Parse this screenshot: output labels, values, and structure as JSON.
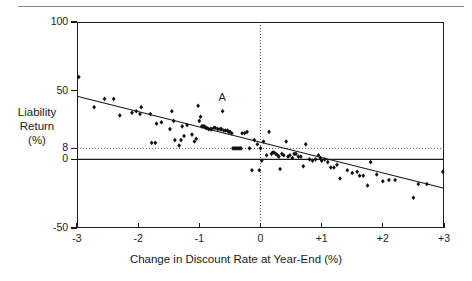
{
  "figure": {
    "top_rule": "horizontal-rule",
    "annotation_label": "A"
  },
  "chart_data": {
    "type": "scatter",
    "title": "",
    "xlabel": "Change in Discount Rate at Year-End (%)",
    "ylabel": "Liability Return (%)",
    "ylabel_lines": [
      "Liability",
      "Return",
      "(%)"
    ],
    "xlim": [
      -3,
      3
    ],
    "ylim": [
      -50,
      100
    ],
    "xticks": [
      -3,
      -2,
      -1,
      0,
      1,
      2,
      3
    ],
    "xticklabels": [
      "-3",
      "-2",
      "-1",
      "0",
      "+1",
      "+2",
      "+3"
    ],
    "yticks": [
      100,
      50,
      8,
      0,
      -50
    ],
    "yticklabels": [
      "100",
      "50",
      "8",
      "0",
      "-50"
    ],
    "grid": false,
    "reference_lines": [
      {
        "name": "zero-return-line",
        "axis": "y",
        "value": 0,
        "style": "solid"
      },
      {
        "name": "eight-percent-line",
        "axis": "y",
        "value": 8,
        "style": "dotted"
      },
      {
        "name": "zero-rate-change-line",
        "axis": "x",
        "value": 0,
        "style": "dotted"
      }
    ],
    "fit_line": {
      "name": "regression-line",
      "x": [
        -3,
        3
      ],
      "y": [
        46,
        -21
      ]
    },
    "annotations": [
      {
        "label": "A",
        "x": -0.62,
        "y": 40
      }
    ],
    "points": [
      [
        -2.97,
        60
      ],
      [
        -2.72,
        38
      ],
      [
        -2.55,
        44
      ],
      [
        -2.4,
        44
      ],
      [
        -2.3,
        32
      ],
      [
        -2.1,
        34
      ],
      [
        -2.03,
        35
      ],
      [
        -1.97,
        33
      ],
      [
        -1.95,
        38
      ],
      [
        -1.8,
        33
      ],
      [
        -1.78,
        12
      ],
      [
        -1.72,
        12
      ],
      [
        -1.7,
        26
      ],
      [
        -1.62,
        27
      ],
      [
        -1.48,
        22
      ],
      [
        -1.45,
        35
      ],
      [
        -1.42,
        28
      ],
      [
        -1.4,
        14
      ],
      [
        -1.33,
        10
      ],
      [
        -1.3,
        14
      ],
      [
        -1.28,
        24
      ],
      [
        -1.25,
        17
      ],
      [
        -1.2,
        25
      ],
      [
        -1.12,
        18
      ],
      [
        -1.08,
        13
      ],
      [
        -1.05,
        15
      ],
      [
        -1.02,
        39
      ],
      [
        -1.0,
        28
      ],
      [
        -0.98,
        31
      ],
      [
        -0.96,
        24
      ],
      [
        -0.94,
        24
      ],
      [
        -0.92,
        24
      ],
      [
        -0.9,
        23
      ],
      [
        -0.88,
        23
      ],
      [
        -0.85,
        22
      ],
      [
        -0.82,
        22
      ],
      [
        -0.8,
        22
      ],
      [
        -0.76,
        23
      ],
      [
        -0.74,
        23
      ],
      [
        -0.7,
        22
      ],
      [
        -0.66,
        22
      ],
      [
        -0.64,
        22
      ],
      [
        -0.62,
        35
      ],
      [
        -0.6,
        21
      ],
      [
        -0.57,
        21
      ],
      [
        -0.54,
        21
      ],
      [
        -0.52,
        20
      ],
      [
        -0.5,
        20
      ],
      [
        -0.47,
        19
      ],
      [
        -0.45,
        8
      ],
      [
        -0.42,
        8
      ],
      [
        -0.4,
        8
      ],
      [
        -0.37,
        8
      ],
      [
        -0.35,
        8
      ],
      [
        -0.32,
        8
      ],
      [
        -0.3,
        19
      ],
      [
        -0.26,
        19
      ],
      [
        -0.22,
        20
      ],
      [
        -0.18,
        8
      ],
      [
        -0.14,
        -8
      ],
      [
        -0.1,
        14
      ],
      [
        -0.05,
        11
      ],
      [
        -0.02,
        -8
      ],
      [
        0.0,
        8
      ],
      [
        0.02,
        -1
      ],
      [
        0.05,
        13
      ],
      [
        0.1,
        3
      ],
      [
        0.14,
        20
      ],
      [
        0.18,
        4
      ],
      [
        0.2,
        5
      ],
      [
        0.22,
        5
      ],
      [
        0.25,
        4
      ],
      [
        0.28,
        3
      ],
      [
        0.3,
        2
      ],
      [
        0.32,
        -7
      ],
      [
        0.35,
        4
      ],
      [
        0.38,
        3
      ],
      [
        0.42,
        13
      ],
      [
        0.45,
        2
      ],
      [
        0.48,
        3
      ],
      [
        0.52,
        1
      ],
      [
        0.55,
        4
      ],
      [
        0.58,
        4
      ],
      [
        0.62,
        2
      ],
      [
        0.66,
        2
      ],
      [
        0.7,
        -5
      ],
      [
        0.74,
        11
      ],
      [
        0.8,
        0
      ],
      [
        0.85,
        -1
      ],
      [
        0.9,
        0
      ],
      [
        0.95,
        3
      ],
      [
        0.98,
        1
      ],
      [
        1.0,
        -1
      ],
      [
        1.05,
        0
      ],
      [
        1.1,
        -2
      ],
      [
        1.15,
        -6
      ],
      [
        1.2,
        -6
      ],
      [
        1.25,
        -4
      ],
      [
        1.3,
        -14
      ],
      [
        1.42,
        -8
      ],
      [
        1.5,
        -10
      ],
      [
        1.58,
        -9
      ],
      [
        1.62,
        -12
      ],
      [
        1.68,
        -12
      ],
      [
        1.75,
        -19
      ],
      [
        1.8,
        -2
      ],
      [
        1.9,
        -11
      ],
      [
        2.0,
        -16
      ],
      [
        2.1,
        -15
      ],
      [
        2.2,
        -15
      ],
      [
        2.5,
        -28
      ],
      [
        2.58,
        -18
      ],
      [
        2.72,
        -18
      ],
      [
        2.98,
        -9
      ]
    ]
  }
}
